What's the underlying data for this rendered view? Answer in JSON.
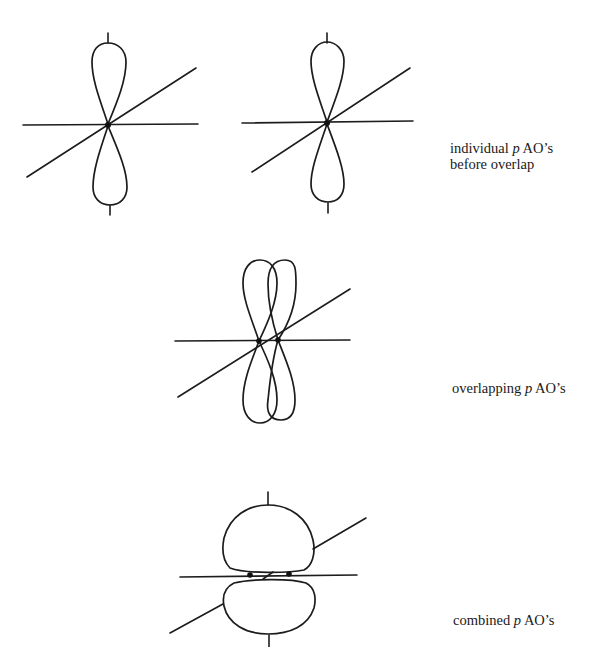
{
  "figure": {
    "panels": [
      {
        "id": "individual",
        "caption_line1_pre": "individual ",
        "caption_line1_var": "p",
        "caption_line1_post": " AO’s",
        "caption_line2": "before overlap",
        "orbitals": 2,
        "description": "two separate p orbitals, each with axes"
      },
      {
        "id": "overlapping",
        "caption_pre": "overlapping ",
        "caption_var": "p",
        "caption_post": " AO’s",
        "orbitals": 2,
        "description": "two p orbitals side by side overlapping"
      },
      {
        "id": "combined",
        "caption_pre": "combined ",
        "caption_var": "p",
        "caption_post": " AO’s",
        "orbitals": 1,
        "description": "combined pi orbital with two nuclei"
      }
    ]
  },
  "colors": {
    "ink": "#1c1c1c",
    "background": "#ffffff"
  }
}
